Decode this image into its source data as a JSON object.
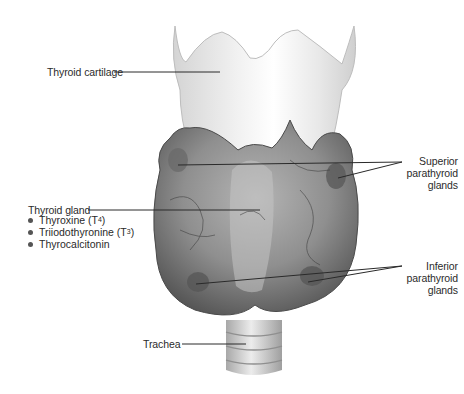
{
  "figure": {
    "background": "#ffffff",
    "tones": {
      "cartilage": "#e6e6e6",
      "gland": "#8c8c8c",
      "gland_shadow": "#5e5e5e",
      "trachea": "#d2d2d2",
      "leader_line": "#2a2a2a"
    }
  },
  "labels": {
    "thyroid_cartilage": "Thyroid cartilage",
    "thyroid_gland": "Thyroid gland",
    "hormones": [
      {
        "name": "Thyroxine (T",
        "sub": "4",
        "close": ")"
      },
      {
        "name": "Triiodothyronine (T",
        "sub": "3",
        "close": ")"
      },
      {
        "name": "Thyrocalcitonin",
        "sub": "",
        "close": ""
      }
    ],
    "superior_parathyroid": [
      "Superior",
      "parathyroid",
      "glands"
    ],
    "inferior_parathyroid": [
      "Inferior",
      "parathyroid",
      "glands"
    ],
    "trachea": "Trachea"
  }
}
